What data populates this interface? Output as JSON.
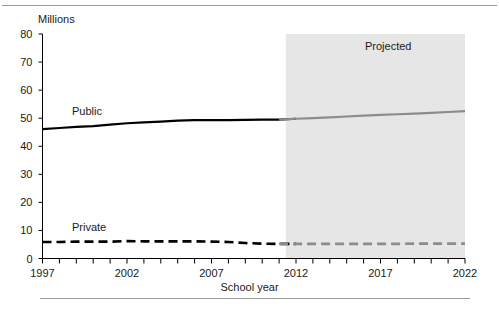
{
  "chart_data": {
    "type": "line",
    "title": "",
    "xlabel": "School year",
    "ylabel": "Millions",
    "unit_label": "Millions",
    "xlim": [
      1997,
      2022
    ],
    "ylim": [
      0,
      80
    ],
    "ytick_values": [
      0,
      10,
      20,
      30,
      40,
      50,
      60,
      70,
      80
    ],
    "xtick_labels": [
      "1997",
      "2002",
      "2007",
      "2012",
      "2017",
      "2022"
    ],
    "xtick_label_values": [
      1997,
      2002,
      2007,
      2012,
      2017,
      2022
    ],
    "xtick_minor_step": 1,
    "grid": false,
    "legend_position": "inline-labels",
    "annotations": [
      {
        "text": "Projected",
        "x": 2019.5,
        "y": 76
      }
    ],
    "shaded_region": {
      "label": "Projected",
      "x_start": 2011.4,
      "x_end": 2022,
      "color": "#e6e6e6"
    },
    "x": [
      1997,
      1998,
      1999,
      2000,
      2001,
      2002,
      2003,
      2004,
      2005,
      2006,
      2007,
      2008,
      2009,
      2010,
      2011,
      2012,
      2013,
      2014,
      2015,
      2016,
      2017,
      2018,
      2019,
      2020,
      2021,
      2022
    ],
    "series": [
      {
        "name": "Public",
        "style": "solid",
        "color_actual": "#000000",
        "color_projected": "#8c8c8c",
        "values": [
          46.1,
          46.5,
          46.9,
          47.2,
          47.7,
          48.2,
          48.5,
          48.8,
          49.1,
          49.3,
          49.3,
          49.3,
          49.4,
          49.5,
          49.5,
          49.8,
          50.0,
          50.3,
          50.6,
          50.9,
          51.2,
          51.4,
          51.6,
          51.9,
          52.2,
          52.5
        ]
      },
      {
        "name": "Private",
        "style": "dashed",
        "color_actual": "#000000",
        "color_projected": "#8c8c8c",
        "values": [
          5.9,
          5.9,
          6.0,
          6.0,
          6.0,
          6.2,
          6.1,
          6.1,
          6.1,
          6.1,
          6.0,
          5.9,
          5.5,
          5.3,
          5.2,
          5.2,
          5.2,
          5.2,
          5.2,
          5.2,
          5.2,
          5.2,
          5.3,
          5.3,
          5.3,
          5.3
        ]
      }
    ]
  }
}
